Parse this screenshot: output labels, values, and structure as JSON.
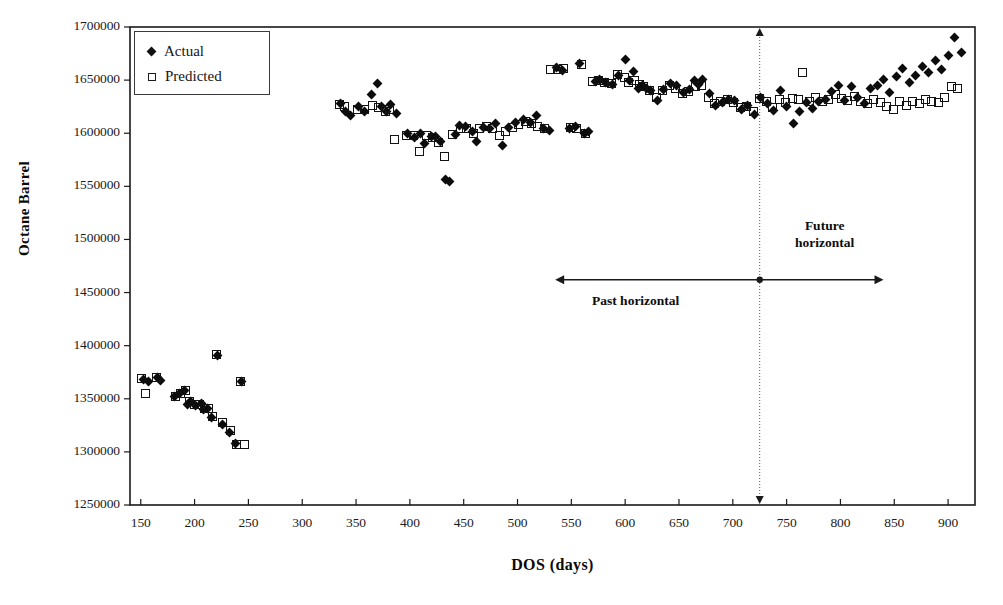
{
  "chart_data": {
    "type": "scatter",
    "title": "",
    "xlabel": "DOS (days)",
    "ylabel": "Octane Barrel",
    "xlim": [
      140,
      925
    ],
    "ylim": [
      1250000,
      1700000
    ],
    "grid": false,
    "legend_position": "top-left",
    "xticks": [
      150,
      200,
      250,
      300,
      350,
      400,
      450,
      500,
      550,
      600,
      650,
      700,
      750,
      800,
      850,
      900
    ],
    "yticks": [
      1250000,
      1300000,
      1350000,
      1400000,
      1450000,
      1500000,
      1550000,
      1600000,
      1650000,
      1700000
    ],
    "series": [
      {
        "name": "Actual",
        "marker": "filled-diamond",
        "color": "#0c0c0c",
        "points": [
          [
            153,
            1368000
          ],
          [
            157,
            1366000
          ],
          [
            166,
            1370000
          ],
          [
            168,
            1367000
          ],
          [
            181,
            1352000
          ],
          [
            186,
            1355000
          ],
          [
            191,
            1358000
          ],
          [
            193,
            1345000
          ],
          [
            196,
            1347000
          ],
          [
            201,
            1344000
          ],
          [
            206,
            1346000
          ],
          [
            208,
            1340000
          ],
          [
            212,
            1341000
          ],
          [
            216,
            1332000
          ],
          [
            221,
            1391000
          ],
          [
            226,
            1326000
          ],
          [
            232,
            1318000
          ],
          [
            238,
            1308000
          ],
          [
            244,
            1366000
          ],
          [
            336,
            1628000
          ],
          [
            340,
            1620000
          ],
          [
            345,
            1617000
          ],
          [
            352,
            1625000
          ],
          [
            358,
            1620000
          ],
          [
            364,
            1636000
          ],
          [
            370,
            1647000
          ],
          [
            374,
            1625000
          ],
          [
            378,
            1620000
          ],
          [
            382,
            1627000
          ],
          [
            388,
            1619000
          ],
          [
            398,
            1600000
          ],
          [
            404,
            1596000
          ],
          [
            410,
            1600000
          ],
          [
            414,
            1590000
          ],
          [
            420,
            1597000
          ],
          [
            424,
            1597000
          ],
          [
            428,
            1592000
          ],
          [
            433,
            1556000
          ],
          [
            437,
            1555000
          ],
          [
            442,
            1599000
          ],
          [
            446,
            1607000
          ],
          [
            452,
            1606000
          ],
          [
            458,
            1602000
          ],
          [
            462,
            1592000
          ],
          [
            468,
            1605000
          ],
          [
            474,
            1604000
          ],
          [
            480,
            1609000
          ],
          [
            486,
            1588000
          ],
          [
            492,
            1605000
          ],
          [
            498,
            1610000
          ],
          [
            506,
            1613000
          ],
          [
            512,
            1610000
          ],
          [
            518,
            1617000
          ],
          [
            524,
            1604000
          ],
          [
            530,
            1603000
          ],
          [
            536,
            1662000
          ],
          [
            542,
            1659000
          ],
          [
            548,
            1604000
          ],
          [
            554,
            1606000
          ],
          [
            558,
            1666000
          ],
          [
            562,
            1600000
          ],
          [
            566,
            1602000
          ],
          [
            572,
            1649000
          ],
          [
            576,
            1651000
          ],
          [
            582,
            1648000
          ],
          [
            588,
            1646000
          ],
          [
            594,
            1654000
          ],
          [
            600,
            1669000
          ],
          [
            604,
            1650000
          ],
          [
            608,
            1658000
          ],
          [
            612,
            1642000
          ],
          [
            616,
            1645000
          ],
          [
            620,
            1642000
          ],
          [
            624,
            1640000
          ],
          [
            630,
            1631000
          ],
          [
            636,
            1641000
          ],
          [
            642,
            1647000
          ],
          [
            648,
            1645000
          ],
          [
            654,
            1638000
          ],
          [
            660,
            1641000
          ],
          [
            664,
            1650000
          ],
          [
            668,
            1646000
          ],
          [
            672,
            1651000
          ],
          [
            678,
            1637000
          ],
          [
            684,
            1626000
          ],
          [
            690,
            1629000
          ],
          [
            696,
            1632000
          ],
          [
            702,
            1631000
          ],
          [
            708,
            1622000
          ],
          [
            714,
            1626000
          ],
          [
            720,
            1618000
          ],
          [
            726,
            1634000
          ],
          [
            732,
            1628000
          ],
          [
            738,
            1621000
          ],
          [
            744,
            1640000
          ],
          [
            750,
            1625000
          ],
          [
            756,
            1609000
          ],
          [
            762,
            1620000
          ],
          [
            768,
            1629000
          ],
          [
            774,
            1623000
          ],
          [
            780,
            1630000
          ],
          [
            786,
            1632000
          ],
          [
            792,
            1639000
          ],
          [
            798,
            1645000
          ],
          [
            804,
            1631000
          ],
          [
            810,
            1644000
          ],
          [
            816,
            1634000
          ],
          [
            822,
            1628000
          ],
          [
            828,
            1642000
          ],
          [
            834,
            1645000
          ],
          [
            840,
            1651000
          ],
          [
            846,
            1638000
          ],
          [
            852,
            1653000
          ],
          [
            858,
            1661000
          ],
          [
            864,
            1648000
          ],
          [
            870,
            1654000
          ],
          [
            876,
            1663000
          ],
          [
            882,
            1657000
          ],
          [
            888,
            1668000
          ],
          [
            894,
            1660000
          ],
          [
            900,
            1673000
          ],
          [
            906,
            1690000
          ],
          [
            912,
            1676000
          ]
        ]
      },
      {
        "name": "Predicted",
        "marker": "open-square",
        "color": "#121212",
        "points": [
          [
            151,
            1369000
          ],
          [
            154,
            1355000
          ],
          [
            165,
            1370000
          ],
          [
            182,
            1352000
          ],
          [
            187,
            1355000
          ],
          [
            192,
            1358000
          ],
          [
            195,
            1347000
          ],
          [
            200,
            1345000
          ],
          [
            205,
            1345000
          ],
          [
            209,
            1341000
          ],
          [
            213,
            1341000
          ],
          [
            217,
            1333000
          ],
          [
            220,
            1392000
          ],
          [
            226,
            1328000
          ],
          [
            233,
            1320000
          ],
          [
            239,
            1307000
          ],
          [
            246,
            1307000
          ],
          [
            243,
            1366000
          ],
          [
            335,
            1627000
          ],
          [
            339,
            1625000
          ],
          [
            351,
            1622000
          ],
          [
            358,
            1622000
          ],
          [
            365,
            1626000
          ],
          [
            371,
            1624000
          ],
          [
            377,
            1620000
          ],
          [
            381,
            1622000
          ],
          [
            386,
            1594000
          ],
          [
            397,
            1598000
          ],
          [
            403,
            1598000
          ],
          [
            409,
            1583000
          ],
          [
            415,
            1598000
          ],
          [
            421,
            1596000
          ],
          [
            427,
            1591000
          ],
          [
            432,
            1578000
          ],
          [
            440,
            1599000
          ],
          [
            447,
            1604000
          ],
          [
            453,
            1604000
          ],
          [
            459,
            1600000
          ],
          [
            465,
            1604000
          ],
          [
            471,
            1606000
          ],
          [
            477,
            1604000
          ],
          [
            483,
            1598000
          ],
          [
            489,
            1602000
          ],
          [
            495,
            1605000
          ],
          [
            501,
            1608000
          ],
          [
            507,
            1611000
          ],
          [
            513,
            1609000
          ],
          [
            519,
            1606000
          ],
          [
            525,
            1604000
          ],
          [
            531,
            1660000
          ],
          [
            537,
            1660000
          ],
          [
            543,
            1661000
          ],
          [
            549,
            1605000
          ],
          [
            555,
            1604000
          ],
          [
            559,
            1665000
          ],
          [
            563,
            1600000
          ],
          [
            570,
            1649000
          ],
          [
            575,
            1650000
          ],
          [
            581,
            1648000
          ],
          [
            587,
            1647000
          ],
          [
            593,
            1655000
          ],
          [
            599,
            1652000
          ],
          [
            603,
            1648000
          ],
          [
            609,
            1650000
          ],
          [
            613,
            1646000
          ],
          [
            617,
            1644000
          ],
          [
            623,
            1640000
          ],
          [
            629,
            1634000
          ],
          [
            635,
            1640000
          ],
          [
            641,
            1645000
          ],
          [
            647,
            1642000
          ],
          [
            653,
            1637000
          ],
          [
            659,
            1639000
          ],
          [
            665,
            1644000
          ],
          [
            671,
            1645000
          ],
          [
            677,
            1634000
          ],
          [
            683,
            1628000
          ],
          [
            689,
            1630000
          ],
          [
            695,
            1632000
          ],
          [
            701,
            1629000
          ],
          [
            707,
            1624000
          ],
          [
            713,
            1625000
          ],
          [
            719,
            1620000
          ],
          [
            725,
            1633000
          ],
          [
            731,
            1630000
          ],
          [
            737,
            1624000
          ],
          [
            743,
            1632000
          ],
          [
            749,
            1629000
          ],
          [
            755,
            1633000
          ],
          [
            761,
            1632000
          ],
          [
            765,
            1657000
          ],
          [
            771,
            1630000
          ],
          [
            777,
            1634000
          ],
          [
            783,
            1630000
          ],
          [
            789,
            1632000
          ],
          [
            795,
            1636000
          ],
          [
            801,
            1633000
          ],
          [
            807,
            1631000
          ],
          [
            813,
            1635000
          ],
          [
            819,
            1630000
          ],
          [
            825,
            1628000
          ],
          [
            831,
            1632000
          ],
          [
            837,
            1629000
          ],
          [
            843,
            1625000
          ],
          [
            849,
            1622000
          ],
          [
            855,
            1630000
          ],
          [
            861,
            1626000
          ],
          [
            867,
            1630000
          ],
          [
            873,
            1628000
          ],
          [
            879,
            1632000
          ],
          [
            885,
            1630000
          ],
          [
            891,
            1629000
          ],
          [
            897,
            1634000
          ],
          [
            903,
            1644000
          ],
          [
            909,
            1642000
          ]
        ]
      }
    ],
    "annotations": [
      {
        "id": "past",
        "text": "Past horizontal",
        "x_start": 535,
        "x_end": 725,
        "y": 1462000
      },
      {
        "id": "future",
        "text": "Future\nhorizontal",
        "x_start": 725,
        "x_end": 840,
        "y": 1462000
      }
    ],
    "reference_line": {
      "x": 725,
      "style": "dotted",
      "arrows": "both"
    }
  },
  "axes": {
    "y_title": "Octane Barrel",
    "x_title": "DOS (days)",
    "y_tick_labels": [
      "1700000",
      "1650000",
      "1600000",
      "1550000",
      "1500000",
      "1450000",
      "1400000",
      "1350000",
      "1300000",
      "1250000"
    ],
    "x_tick_labels": [
      "150",
      "200",
      "250",
      "300",
      "350",
      "400",
      "450",
      "500",
      "550",
      "600",
      "650",
      "700",
      "750",
      "800",
      "850",
      "900"
    ]
  },
  "legend": {
    "entries": [
      {
        "label": "Actual",
        "marker": "filled-diamond-icon"
      },
      {
        "label": "Predicted",
        "marker": "open-square-icon"
      }
    ]
  },
  "annotation_labels": {
    "past": "Past horizontal",
    "future_line1": "Future",
    "future_line2": "horizontal"
  },
  "colors": {
    "actual": "#0c0c0c",
    "predicted": "#121212",
    "axis": "#1a1a1a",
    "background": "#ffffff"
  }
}
